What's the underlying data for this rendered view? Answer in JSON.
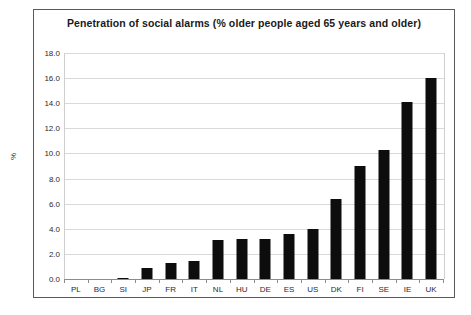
{
  "chart_data": {
    "type": "bar",
    "title": "Penetration of social alarms (% older people aged 65 years and older)",
    "xlabel": "",
    "ylabel": "%",
    "categories": [
      "PL",
      "BG",
      "SI",
      "JP",
      "FR",
      "IT",
      "NL",
      "HU",
      "DE",
      "ES",
      "US",
      "DK",
      "FI",
      "SE",
      "IE",
      "UK"
    ],
    "values": [
      0.0,
      0.0,
      0.1,
      0.9,
      1.3,
      1.4,
      3.1,
      3.2,
      3.2,
      3.6,
      4.0,
      6.4,
      9.0,
      10.3,
      14.1,
      16.0
    ],
    "ylim": [
      0.0,
      18.0
    ],
    "ytick_labels": [
      "0.0",
      "2.0",
      "4.0",
      "6.0",
      "8.0",
      "10.0",
      "12.0",
      "14.0",
      "16.0",
      "18.0"
    ],
    "ytick_values": [
      0.0,
      2.0,
      4.0,
      6.0,
      8.0,
      10.0,
      12.0,
      14.0,
      16.0,
      18.0
    ],
    "grid": true,
    "legend": false,
    "bar_color": "#0d0d0d",
    "grid_color": "#d9d9d9",
    "background_color": "#ffffff"
  }
}
